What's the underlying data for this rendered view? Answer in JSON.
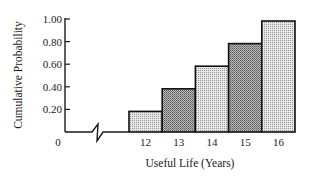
{
  "chart_data": {
    "type": "bar",
    "title": "",
    "xlabel": "Useful Life (Years)",
    "ylabel": "Cumulative Probability",
    "categories": [
      "12",
      "13",
      "14",
      "15",
      "16"
    ],
    "values": [
      0.2,
      0.4,
      0.6,
      0.8,
      1.0
    ],
    "ylim": [
      0,
      1.0
    ],
    "yticks": [
      "0.20",
      "0.40",
      "0.60",
      "0.80",
      "1.00"
    ],
    "origin_label": "0",
    "grid": false,
    "legend": null,
    "axis_break": true,
    "bar_fills": [
      "#d9d9d9",
      "#a8a8a8",
      "#d9d9d9",
      "#a8a8a8",
      "#d9d9d9"
    ]
  }
}
